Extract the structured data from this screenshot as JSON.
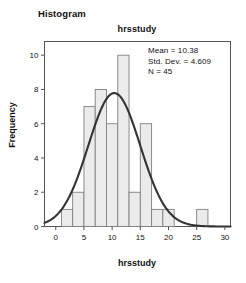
{
  "figure": {
    "title": "Histogram",
    "chart_title": "hrsstudy",
    "xlabel": "hrsstudy",
    "ylabel": "Frequency"
  },
  "stats": {
    "mean_label": "Mean = 10.38",
    "sd_label": "Std. Dev. = 4.609",
    "n_label": "N = 45"
  },
  "colors": {
    "bar_fill": "#ebebeb",
    "bar_stroke": "#808080",
    "curve": "#333333",
    "frame": "#555555",
    "text": "#111111"
  },
  "chart_data": {
    "type": "bar",
    "title": "hrsstudy",
    "xlabel": "hrsstudy",
    "ylabel": "Frequency",
    "xlim": [
      -2,
      31
    ],
    "ylim": [
      0,
      10.8
    ],
    "xticks": [
      0,
      5,
      10,
      15,
      20,
      25,
      30
    ],
    "yticks": [
      0,
      2,
      4,
      6,
      8,
      10
    ],
    "grid": false,
    "legend": null,
    "bin_width": 2,
    "bin_starts": [
      1,
      3,
      5,
      7,
      9,
      11,
      13,
      15,
      17,
      19,
      21,
      23,
      25
    ],
    "categories": [
      "1-3",
      "3-5",
      "5-7",
      "7-9",
      "9-11",
      "11-13",
      "13-15",
      "15-17",
      "17-19",
      "19-21",
      "21-23",
      "23-25",
      "25-27"
    ],
    "values": [
      1,
      2,
      7,
      8,
      6,
      10,
      2,
      6,
      1,
      1,
      0,
      0,
      1
    ],
    "overlay": {
      "type": "normal-curve",
      "mean": 10.38,
      "std_dev": 4.609,
      "n": 45,
      "scale_bin_width": 2
    },
    "annotations": [
      "Mean = 10.38",
      "Std. Dev. = 4.609",
      "N = 45"
    ]
  }
}
